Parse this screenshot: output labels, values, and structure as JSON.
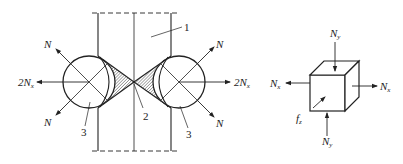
{
  "figure": {
    "left_diagram": {
      "description": "Two circular rollers pressing a welded seam between two plates",
      "parts": [
        {
          "id": "1",
          "label": "1",
          "meaning": "plate"
        },
        {
          "id": "2",
          "label": "2",
          "meaning": "seam / weld zone (hatched)"
        },
        {
          "id": "3",
          "label": "3",
          "meaning": "roller"
        }
      ],
      "labels": {
        "part1": "1",
        "part2": "2",
        "part3_left": "3",
        "part3_right": "3",
        "force_N_upper_left": "N",
        "force_N_lower_left": "N",
        "force_N_upper_right": "N",
        "force_N_lower_right": "N",
        "force_2Nx_left_coef": "2N",
        "force_2Nx_left_sub": "x",
        "force_2Nx_right_coef": "2N",
        "force_2Nx_right_sub": "x"
      }
    },
    "right_diagram": {
      "description": "Stress element cube with normal and shear forces",
      "labels": {
        "Ny_top_main": "N",
        "Ny_top_sub": "y",
        "Ny_bottom_main": "N",
        "Ny_bottom_sub": "y",
        "Nx_left_main": "N",
        "Nx_left_sub": "x",
        "Nx_right_main": "N",
        "Nx_right_sub": "x",
        "fz_main": "f",
        "fz_sub": "z"
      }
    },
    "colors": {
      "line": "#222222",
      "background": "#ffffff"
    }
  }
}
